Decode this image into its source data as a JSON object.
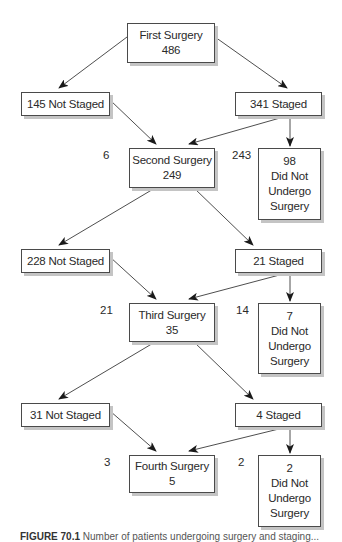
{
  "nodes": {
    "first_surgery": {
      "title": "First Surgery",
      "value": "486"
    },
    "not_staged_1": {
      "label": "145 Not Staged"
    },
    "staged_1": {
      "label": "341 Staged"
    },
    "second_surgery": {
      "title": "Second Surgery",
      "value": "249"
    },
    "no_surgery_1": {
      "value": "98",
      "line1": "Did Not",
      "line2": "Undergo",
      "line3": "Surgery"
    },
    "not_staged_2": {
      "label": "228 Not Staged"
    },
    "staged_2": {
      "label": "21 Staged"
    },
    "third_surgery": {
      "title": "Third Surgery",
      "value": "35"
    },
    "no_surgery_2": {
      "value": "7",
      "line1": "Did Not",
      "line2": "Undergo",
      "line3": "Surgery"
    },
    "not_staged_3": {
      "label": "31 Not Staged"
    },
    "staged_3": {
      "label": "4 Staged"
    },
    "fourth_surgery": {
      "title": "Fourth Surgery",
      "value": "5"
    },
    "no_surgery_3": {
      "value": "2",
      "line1": "Did Not",
      "line2": "Undergo",
      "line3": "Surgery"
    }
  },
  "edge_counts": {
    "from_not_staged_1": "6",
    "from_staged_1": "243",
    "from_not_staged_2": "21",
    "from_staged_2": "14",
    "from_not_staged_3": "3",
    "from_staged_3": "2"
  },
  "edges": [
    {
      "from": "first_surgery",
      "to": "not_staged_1"
    },
    {
      "from": "first_surgery",
      "to": "staged_1"
    },
    {
      "from": "not_staged_1",
      "to": "second_surgery"
    },
    {
      "from": "staged_1",
      "to": "second_surgery"
    },
    {
      "from": "staged_1",
      "to": "no_surgery_1"
    },
    {
      "from": "second_surgery",
      "to": "not_staged_2"
    },
    {
      "from": "second_surgery",
      "to": "staged_2"
    },
    {
      "from": "not_staged_2",
      "to": "third_surgery"
    },
    {
      "from": "staged_2",
      "to": "third_surgery"
    },
    {
      "from": "staged_2",
      "to": "no_surgery_2"
    },
    {
      "from": "third_surgery",
      "to": "not_staged_3"
    },
    {
      "from": "third_surgery",
      "to": "staged_3"
    },
    {
      "from": "not_staged_3",
      "to": "fourth_surgery"
    },
    {
      "from": "staged_3",
      "to": "fourth_surgery"
    },
    {
      "from": "staged_3",
      "to": "no_surgery_3"
    }
  ],
  "caption": {
    "label": "FIGURE 70.1",
    "text": "Number of patients undergoing surgery and staging..."
  }
}
